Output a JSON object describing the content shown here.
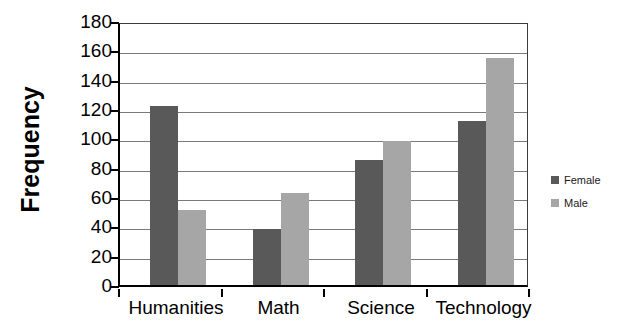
{
  "chart_data": {
    "type": "bar",
    "title": "",
    "subtitle": "",
    "xlabel": "",
    "ylabel": "Frequency",
    "categories": [
      "Humanities",
      "Math",
      "Science",
      "Technology"
    ],
    "series": [
      {
        "name": "Female",
        "color": "#595959",
        "values": [
          122,
          38,
          85,
          112
        ]
      },
      {
        "name": "Male",
        "color": "#a6a6a6",
        "values": [
          51,
          63,
          98,
          155
        ]
      }
    ],
    "ylim": [
      0,
      180
    ],
    "ytick_step": 20,
    "yticks": [
      0,
      20,
      40,
      60,
      80,
      100,
      120,
      140,
      160,
      180
    ],
    "ytick_labels": [
      "0",
      "20",
      "40",
      "60",
      "80",
      "100",
      "120",
      "140",
      "160",
      "180"
    ],
    "grid": true,
    "grid_axis": "y",
    "legend_position": "right",
    "legend_entries": [
      "Female",
      "Male"
    ],
    "plot_background": "#ffffff",
    "axis_color": "#000000",
    "gridline_color": "#7a7a7a"
  }
}
